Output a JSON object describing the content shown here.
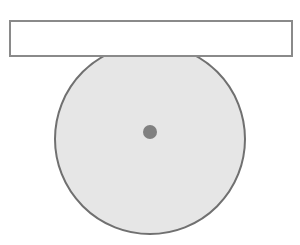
{
  "diagram": {
    "type": "geometry-figure",
    "canvas": {
      "width": 300,
      "height": 245,
      "background": "#ffffff"
    },
    "elements": {
      "rectangle": {
        "label": "",
        "x": 10,
        "y": 21,
        "width": 282,
        "height": 35,
        "fill": "#ffffff",
        "stroke": "#8a8a8a",
        "stroke_width": 2
      },
      "circle": {
        "label": "",
        "cx": 150,
        "cy": 139,
        "r": 95,
        "clip_top_y": 56,
        "fill": "#e6e6e6",
        "stroke": "#707070",
        "stroke_width": 2
      },
      "center_dot": {
        "label": "",
        "cx": 150,
        "cy": 132,
        "r": 7,
        "fill": "#808080"
      }
    }
  }
}
